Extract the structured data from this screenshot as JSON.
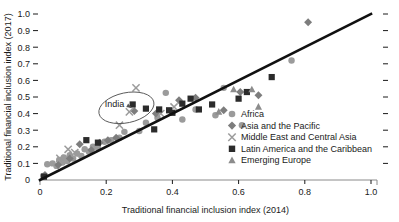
{
  "chart_data": {
    "type": "scatter",
    "title": "",
    "xlabel": "Traditional financial inclusion index (2014)",
    "ylabel": "Traditional financial inclusion index (2017)",
    "xlim": [
      0,
      1.0
    ],
    "ylim": [
      0,
      1.0
    ],
    "xticks": [
      "0",
      "0.2",
      "0.4",
      "0.6",
      "0.8",
      "1.0"
    ],
    "xtick_values": [
      0,
      0.2,
      0.4,
      0.6,
      0.8,
      1.0
    ],
    "yticks": [
      "0",
      "0.1",
      "0.2",
      "0.3",
      "0.4",
      "0.5",
      "0.6",
      "0.7",
      "0.8",
      "0.9",
      "1.0"
    ],
    "ytick_values": [
      0,
      0.1,
      0.2,
      0.3,
      0.4,
      0.5,
      0.6,
      0.7,
      0.8,
      0.9,
      1.0
    ],
    "grid": false,
    "legend_position": "center-right",
    "reference_line": {
      "name": "45-degree line",
      "from": [
        0.0,
        0.0
      ],
      "to": [
        1.0,
        1.0
      ]
    },
    "annotations": [
      {
        "text": "India",
        "marker_point": [
          0.285,
          0.415
        ],
        "label_point": [
          0.225,
          0.455
        ]
      }
    ],
    "series": [
      {
        "name": "Africa",
        "marker": "circle",
        "color": "#9b9b9b",
        "points": [
          [
            0.01,
            0.025
          ],
          [
            0.022,
            0.095
          ],
          [
            0.038,
            0.1
          ],
          [
            0.05,
            0.085
          ],
          [
            0.058,
            0.12
          ],
          [
            0.068,
            0.105
          ],
          [
            0.072,
            0.135
          ],
          [
            0.082,
            0.115
          ],
          [
            0.09,
            0.15
          ],
          [
            0.1,
            0.13
          ],
          [
            0.112,
            0.16
          ],
          [
            0.125,
            0.145
          ],
          [
            0.135,
            0.185
          ],
          [
            0.148,
            0.17
          ],
          [
            0.16,
            0.2
          ],
          [
            0.175,
            0.195
          ],
          [
            0.195,
            0.23
          ],
          [
            0.215,
            0.24
          ],
          [
            0.24,
            0.255
          ],
          [
            0.255,
            0.29
          ],
          [
            0.3,
            0.295
          ],
          [
            0.32,
            0.345
          ],
          [
            0.355,
            0.375
          ],
          [
            0.38,
            0.525
          ],
          [
            0.43,
            0.365
          ],
          [
            0.47,
            0.425
          ],
          [
            0.53,
            0.39
          ],
          [
            0.555,
            0.555
          ],
          [
            0.61,
            0.33
          ],
          [
            0.76,
            0.72
          ]
        ]
      },
      {
        "name": "Asia and the Pacific",
        "marker": "diamond",
        "color": "#7d7d7d",
        "points": [
          [
            0.015,
            0.03
          ],
          [
            0.055,
            0.09
          ],
          [
            0.09,
            0.13
          ],
          [
            0.12,
            0.215
          ],
          [
            0.155,
            0.18
          ],
          [
            0.18,
            0.225
          ],
          [
            0.205,
            0.24
          ],
          [
            0.23,
            0.255
          ],
          [
            0.285,
            0.415
          ],
          [
            0.35,
            0.4
          ],
          [
            0.42,
            0.48
          ],
          [
            0.47,
            0.495
          ],
          [
            0.555,
            0.42
          ],
          [
            0.605,
            0.53
          ],
          [
            0.66,
            0.51
          ],
          [
            0.81,
            0.95
          ]
        ]
      },
      {
        "name": "Middle East and Central Asia",
        "marker": "x",
        "color": "#9b9b9b",
        "points": [
          [
            0.06,
            0.13
          ],
          [
            0.085,
            0.185
          ],
          [
            0.105,
            0.165
          ],
          [
            0.24,
            0.33
          ],
          [
            0.27,
            0.41
          ],
          [
            0.29,
            0.555
          ],
          [
            0.365,
            0.4
          ],
          [
            0.405,
            0.44
          ]
        ]
      },
      {
        "name": "Latin America and the Caribbean",
        "marker": "square",
        "color": "#2b2b2b",
        "points": [
          [
            0.012,
            0.02
          ],
          [
            0.14,
            0.24
          ],
          [
            0.175,
            0.225
          ],
          [
            0.28,
            0.455
          ],
          [
            0.32,
            0.43
          ],
          [
            0.345,
            0.305
          ],
          [
            0.36,
            0.425
          ],
          [
            0.39,
            0.42
          ],
          [
            0.4,
            0.405
          ],
          [
            0.43,
            0.46
          ],
          [
            0.455,
            0.49
          ],
          [
            0.48,
            0.425
          ],
          [
            0.52,
            0.455
          ],
          [
            0.6,
            0.49
          ],
          [
            0.625,
            0.53
          ],
          [
            0.7,
            0.62
          ]
        ]
      },
      {
        "name": "Emerging Europe",
        "marker": "triangle",
        "color": "#8c8c8c",
        "points": [
          [
            0.54,
            0.41
          ],
          [
            0.585,
            0.545
          ],
          [
            0.64,
            0.545
          ],
          [
            0.66,
            0.44
          ]
        ]
      }
    ]
  },
  "legend": {
    "items": [
      {
        "label": "Africa",
        "marker": "circle"
      },
      {
        "label": "Asia and the Pacific",
        "marker": "diamond"
      },
      {
        "label": "Middle East and Central Asia",
        "marker": "x"
      },
      {
        "label": "Latin America and the Caribbean",
        "marker": "square"
      },
      {
        "label": "Emerging Europe",
        "marker": "triangle"
      }
    ]
  }
}
